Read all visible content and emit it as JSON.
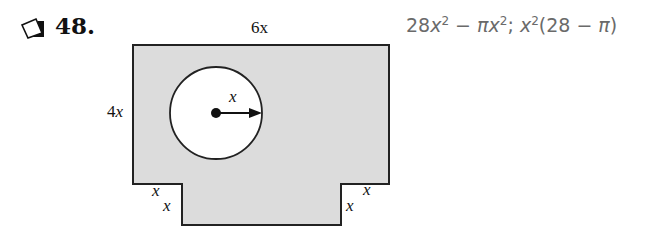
{
  "problem": {
    "number": "48.",
    "icon": "checkbox-icon"
  },
  "answer": {
    "text": "28x² − πx²; x²(28 − π)",
    "part1_coef": "28",
    "part1_var": "x",
    "part1_exp": "2",
    "minus": " − ",
    "pi": "π",
    "part2_var": "x",
    "part2_exp": "2",
    "sep": "; ",
    "factored_var": "x",
    "factored_exp": "2",
    "factored_open": "(28",
    "factored_minus": " − ",
    "factored_pi": "π",
    "factored_close": ")"
  },
  "figure": {
    "fill_color": "#dcdcdc",
    "stroke_color": "#222222",
    "labels": {
      "top_width": "6x",
      "left_height_coef": "4",
      "left_height_var": "x",
      "radius": "x",
      "notch_left_horizontal": "x",
      "notch_left_vertical": "x",
      "notch_right_vertical": "x",
      "notch_right_horizontal": "x"
    }
  }
}
